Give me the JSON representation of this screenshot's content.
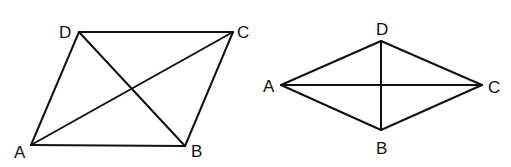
{
  "figures": [
    {
      "name": "parallelogram",
      "vertices": {
        "A": {
          "x": 31,
          "y": 145,
          "label": "A",
          "lx": 14,
          "ly": 158
        },
        "B": {
          "x": 185,
          "y": 146,
          "label": "B",
          "lx": 191,
          "ly": 157
        },
        "C": {
          "x": 233,
          "y": 32,
          "label": "C",
          "lx": 237,
          "ly": 38
        },
        "D": {
          "x": 79,
          "y": 32,
          "label": "D",
          "lx": 59,
          "ly": 38
        }
      },
      "edges": [
        [
          "A",
          "B"
        ],
        [
          "B",
          "C"
        ],
        [
          "C",
          "D"
        ],
        [
          "D",
          "A"
        ],
        [
          "A",
          "C"
        ],
        [
          "B",
          "D"
        ]
      ]
    },
    {
      "name": "rhombus",
      "vertices": {
        "A": {
          "x": 281,
          "y": 85,
          "label": "A",
          "lx": 263,
          "ly": 92
        },
        "B": {
          "x": 381,
          "y": 130,
          "label": "B",
          "lx": 376,
          "ly": 154
        },
        "C": {
          "x": 482,
          "y": 85,
          "label": "C",
          "lx": 488,
          "ly": 93
        },
        "D": {
          "x": 381,
          "y": 41,
          "label": "D",
          "lx": 376,
          "ly": 35
        }
      },
      "edges": [
        [
          "A",
          "B"
        ],
        [
          "B",
          "C"
        ],
        [
          "C",
          "D"
        ],
        [
          "D",
          "A"
        ],
        [
          "A",
          "C"
        ],
        [
          "B",
          "D"
        ]
      ]
    }
  ]
}
